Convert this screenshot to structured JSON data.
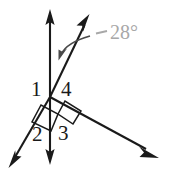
{
  "figure": {
    "type": "geometry-diagram",
    "width": 171,
    "height": 169,
    "background_color": "#ffffff",
    "stroke_color": "#1a1a1a",
    "annotation_color": "#a8a8a8"
  },
  "vertex": {
    "x": 50,
    "y": 97
  },
  "rays": [
    {
      "name": "vertical-up-ray",
      "from": [
        50,
        97
      ],
      "to": [
        50,
        12
      ],
      "arrowhead": "end"
    },
    {
      "name": "vertical-down-ray",
      "from": [
        50,
        97
      ],
      "to": [
        50,
        162
      ],
      "arrowhead": "end"
    },
    {
      "name": "diagonal-upper-right-ray",
      "from": [
        50,
        97
      ],
      "to": [
        88,
        17
      ],
      "arrowhead": "end"
    },
    {
      "name": "diagonal-lower-left-ray",
      "from": [
        50,
        97
      ],
      "to": [
        10,
        166
      ],
      "arrowhead": "end"
    },
    {
      "name": "lower-right-ray",
      "from": [
        50,
        97
      ],
      "to": [
        155,
        155
      ],
      "arrowhead": "end"
    }
  ],
  "angle_labels": [
    {
      "id": "1",
      "text": "1",
      "x": 31,
      "y": 80
    },
    {
      "id": "4",
      "text": "4",
      "x": 61,
      "y": 80
    },
    {
      "id": "2",
      "text": "2",
      "x": 32,
      "y": 125
    },
    {
      "id": "3",
      "text": "3",
      "x": 58,
      "y": 124
    }
  ],
  "measure_annotation": {
    "text": "28°",
    "x": 113,
    "y": 26,
    "color": "#a8a8a8",
    "leader_dash": {
      "from": [
        97,
        33
      ],
      "to": [
        107,
        31
      ]
    },
    "curved_arrow": {
      "from": [
        90,
        36
      ],
      "to": [
        60,
        57
      ]
    }
  },
  "right_angle_markers": [
    {
      "name": "right-angle-marker-left",
      "points": "41,105 32,122 51,131 58,114"
    },
    {
      "name": "right-angle-marker-right",
      "points": "58,114 65,101 81,111 73,124"
    }
  ]
}
